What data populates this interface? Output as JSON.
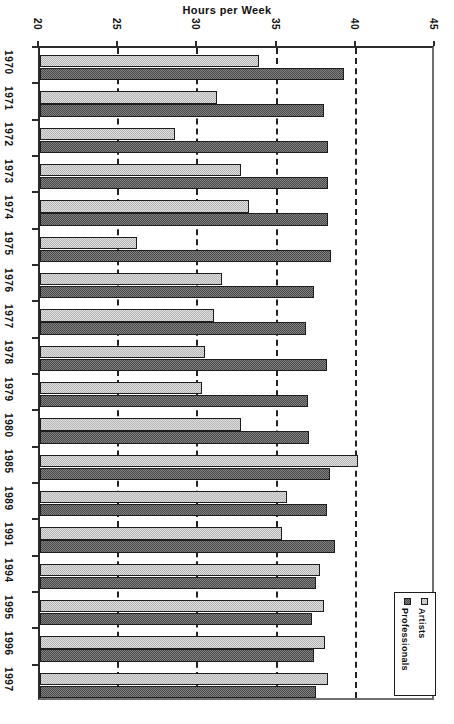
{
  "chart_data": {
    "type": "bar",
    "orientation": "horizontal-rotated-90",
    "title": "Hours per Week",
    "xlabel": "Hours per Week",
    "ylabel": "",
    "xlim": [
      20,
      45
    ],
    "xticks": [
      20,
      25,
      30,
      35,
      40,
      45
    ],
    "xtick_labels": [
      "20",
      "25",
      "30",
      "35",
      "40",
      "45"
    ],
    "grid": true,
    "gridlines_at": [
      25,
      30,
      35,
      40
    ],
    "legend_position": "bottom-right",
    "categories": [
      "1970",
      "1971",
      "1972",
      "1973",
      "1974",
      "1975",
      "1976",
      "1977",
      "1978",
      "1979",
      "1980",
      "1985",
      "1989",
      "1991",
      "1994",
      "1995",
      "1996",
      "1997"
    ],
    "series": [
      {
        "name": "Artists",
        "color": "#b6b6b6",
        "values": [
          33.8,
          31.2,
          28.5,
          32.7,
          33.2,
          26.1,
          31.5,
          31.0,
          30.4,
          30.2,
          32.7,
          40.1,
          35.6,
          35.3,
          37.7,
          37.9,
          38.0,
          38.2
        ]
      },
      {
        "name": "Professionals",
        "color": "#4a4a4a",
        "values": [
          39.2,
          37.9,
          38.2,
          38.2,
          38.2,
          38.4,
          37.3,
          36.8,
          38.1,
          36.9,
          37.0,
          38.3,
          38.1,
          38.6,
          37.4,
          37.2,
          37.3,
          37.4
        ]
      }
    ]
  },
  "legend": {
    "entries": [
      {
        "label": "Artists",
        "swatch": "light-gray"
      },
      {
        "label": "Professionals",
        "swatch": "dark-gray"
      }
    ]
  }
}
